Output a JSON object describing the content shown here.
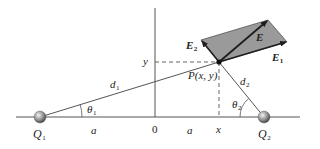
{
  "diagram": {
    "colors": {
      "line": "#555555",
      "parallelogram_fill": "#9a9a9a",
      "arrow": "#1e1e1e",
      "text": "#222222",
      "charge_sphere": "#8c8c8c"
    },
    "labels": {
      "q1": "Q",
      "q1_sub": "1",
      "q2": "Q",
      "q2_sub": "2",
      "origin": "0",
      "a_left": "a",
      "a_right": "a",
      "x_tick": "x",
      "y_tick": "y",
      "point": "P(x, y)",
      "d1": "d",
      "d1_sub": "1",
      "d2": "d",
      "d2_sub": "2",
      "theta1": "θ",
      "theta1_sub": "1",
      "theta2": "θ",
      "theta2_sub": "2",
      "e": "E",
      "e1": "E",
      "e1_sub": "1",
      "e2": "E",
      "e2_sub": "2"
    },
    "nodes": [
      {
        "id": "Q1",
        "kind": "point-charge",
        "position": "x = -a"
      },
      {
        "id": "O",
        "kind": "origin",
        "position": "x = 0"
      },
      {
        "id": "Q2",
        "kind": "point-charge",
        "position": "x = +a"
      },
      {
        "id": "P",
        "kind": "field-point",
        "position": "(x, y)"
      }
    ],
    "edges": [
      {
        "from": "Q1",
        "to": "P",
        "label": "d1",
        "angle_at_source": "θ1"
      },
      {
        "from": "Q2",
        "to": "P",
        "label": "d2",
        "angle_at_source": "θ2"
      }
    ],
    "vectors": [
      {
        "name": "E1",
        "origin": "P",
        "direction": "away from Q1"
      },
      {
        "name": "E2",
        "origin": "P",
        "direction": "toward upper-left (away from Q2)"
      },
      {
        "name": "E",
        "origin": "P",
        "note": "resultant, diagonal of parallelogram E1+E2"
      }
    ]
  }
}
